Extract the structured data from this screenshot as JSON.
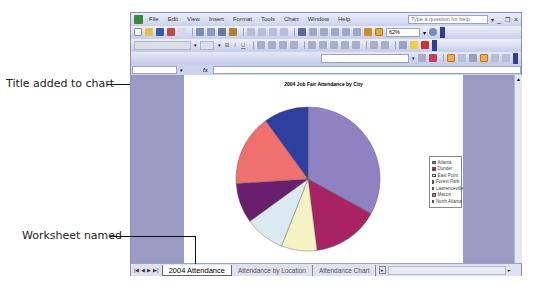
{
  "callouts": {
    "title_added": "Title added to chart",
    "worksheet_named": "Worksheet named"
  },
  "app": {
    "menu": [
      "File",
      "Edit",
      "View",
      "Insert",
      "Format",
      "Tools",
      "Chart",
      "Window",
      "Help"
    ],
    "help_placeholder": "Type a question for help",
    "zoom": "62%",
    "window_controls": [
      "minimize",
      "restore",
      "close"
    ]
  },
  "chart": {
    "title": "2004 Job Fair Attendance by City"
  },
  "chart_data": {
    "type": "pie",
    "title": "2004 Job Fair Attendance by City",
    "categories": [
      "Atlanta",
      "Dunder",
      "East Point",
      "Forest Park",
      "Lawrenceville",
      "Macon",
      "North Atlanta"
    ],
    "values": [
      33,
      15,
      8,
      9,
      9,
      16,
      10
    ],
    "colors": [
      "#8f82c2",
      "#a82363",
      "#f5f3c3",
      "#dbe9f1",
      "#6a1f6e",
      "#f07070",
      "#2e3f9f"
    ],
    "legend_position": "right"
  },
  "sheet_tabs": {
    "items": [
      "2004 Attendance",
      "Attendance by Location",
      "Attendance Chart"
    ],
    "active": 0
  }
}
